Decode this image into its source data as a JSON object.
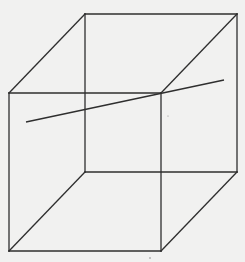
{
  "diagram": {
    "type": "wireframe-cube-with-line",
    "colors": {
      "background": "#f1f1f0",
      "stroke": "#2e2e2e"
    },
    "vertices": {
      "front_top_left": [
        9,
        93
      ],
      "front_top_right": [
        161,
        93
      ],
      "front_bottom_left": [
        9,
        251
      ],
      "front_bottom_right": [
        161,
        251
      ],
      "back_top_left": [
        85,
        14
      ],
      "back_top_right": [
        237,
        14
      ],
      "back_bottom_left": [
        85,
        172
      ],
      "back_bottom_right": [
        237,
        172
      ]
    },
    "edges": [
      {
        "name": "front-top-edge",
        "from": "front_top_left",
        "to": "front_top_right"
      },
      {
        "name": "front-bottom-edge",
        "from": "front_bottom_left",
        "to": "front_bottom_right"
      },
      {
        "name": "front-left-edge",
        "from": "front_top_left",
        "to": "front_bottom_left"
      },
      {
        "name": "front-right-edge",
        "from": "front_top_right",
        "to": "front_bottom_right"
      },
      {
        "name": "back-top-edge",
        "from": "back_top_left",
        "to": "back_top_right"
      },
      {
        "name": "back-bottom-edge",
        "from": "back_bottom_left",
        "to": "back_bottom_right"
      },
      {
        "name": "back-left-edge",
        "from": "back_top_left",
        "to": "back_bottom_left"
      },
      {
        "name": "back-right-edge",
        "from": "back_top_right",
        "to": "back_bottom_right"
      },
      {
        "name": "top-left-connector",
        "from": "front_top_left",
        "to": "back_top_left"
      },
      {
        "name": "top-right-connector",
        "from": "front_top_right",
        "to": "back_top_right"
      },
      {
        "name": "bottom-left-connector",
        "from": "front_bottom_left",
        "to": "back_bottom_left"
      },
      {
        "name": "bottom-right-connector",
        "from": "front_bottom_right",
        "to": "back_bottom_right"
      }
    ],
    "transversal_line": {
      "from": [
        26,
        122
      ],
      "to": [
        224,
        80
      ]
    }
  }
}
